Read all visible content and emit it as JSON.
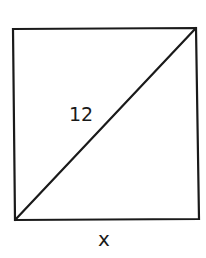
{
  "figure": {
    "shape": "square",
    "stroke_color": "#1a1a1a",
    "background": "#ffffff",
    "diagonal_label": "12",
    "side_label": "x"
  }
}
